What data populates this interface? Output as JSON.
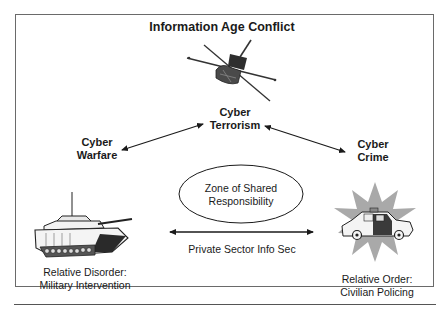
{
  "diagram": {
    "title": "Information Age Conflict",
    "nodes": {
      "cyber_terrorism": {
        "line1": "Cyber",
        "line2": "Terrorism",
        "icon": "satellite-icon"
      },
      "cyber_warfare": {
        "line1": "Cyber",
        "line2": "Warfare"
      },
      "cyber_crime": {
        "line1": "Cyber",
        "line2": "Crime"
      },
      "zone": {
        "line1": "Zone of Shared",
        "line2": "Responsibility"
      },
      "private_sector": {
        "label": "Private Sector Info Sec"
      },
      "military": {
        "line1": "Relative Disorder:",
        "line2": "Military Intervention",
        "icon": "tank-icon"
      },
      "civilian": {
        "line1": "Relative Order:",
        "line2": "Civilian Policing",
        "icon": "police-car-icon"
      }
    },
    "edges": [
      {
        "from": "cyber_warfare",
        "to": "cyber_terrorism",
        "type": "bidirectional-arrow"
      },
      {
        "from": "cyber_terrorism",
        "to": "cyber_crime",
        "type": "bidirectional-arrow"
      },
      {
        "from": "military",
        "to": "civilian",
        "type": "bidirectional-arrow",
        "label": "Private Sector Info Sec"
      }
    ],
    "colors": {
      "line": "#1a1a1a",
      "frame": "#6a6a6a",
      "starburst": "#a9a9a9",
      "dark_fill": "#3a3a3a"
    }
  }
}
